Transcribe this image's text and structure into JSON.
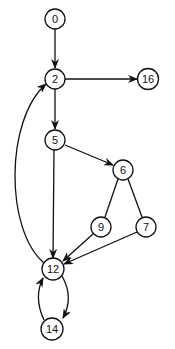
{
  "diagram": {
    "type": "directed-graph",
    "nodes": [
      {
        "id": "0",
        "label": "0",
        "x": 55,
        "y": 19
      },
      {
        "id": "2",
        "label": "2",
        "x": 55,
        "y": 79
      },
      {
        "id": "16",
        "label": "16",
        "x": 148,
        "y": 79
      },
      {
        "id": "5",
        "label": "5",
        "x": 55,
        "y": 140
      },
      {
        "id": "6",
        "label": "6",
        "x": 123,
        "y": 170
      },
      {
        "id": "9",
        "label": "9",
        "x": 101,
        "y": 227
      },
      {
        "id": "7",
        "label": "7",
        "x": 146,
        "y": 227
      },
      {
        "id": "12",
        "label": "12",
        "x": 53,
        "y": 269
      },
      {
        "id": "14",
        "label": "14",
        "x": 52,
        "y": 329
      }
    ],
    "edges": [
      {
        "from": "0",
        "to": "2",
        "directed": true
      },
      {
        "from": "2",
        "to": "16",
        "directed": true
      },
      {
        "from": "2",
        "to": "5",
        "directed": true
      },
      {
        "from": "5",
        "to": "6",
        "directed": true
      },
      {
        "from": "5",
        "to": "12",
        "directed": true
      },
      {
        "from": "6",
        "to": "9",
        "directed": false
      },
      {
        "from": "6",
        "to": "7",
        "directed": false
      },
      {
        "from": "9",
        "to": "12",
        "directed": true
      },
      {
        "from": "7",
        "to": "12",
        "directed": true
      },
      {
        "from": "12",
        "to": "2",
        "directed": true,
        "curved": true
      },
      {
        "from": "12",
        "to": "14",
        "directed": true,
        "curved": true
      },
      {
        "from": "14",
        "to": "12",
        "directed": true,
        "curved": true
      }
    ]
  }
}
